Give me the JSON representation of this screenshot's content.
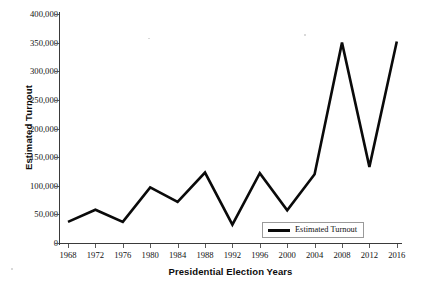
{
  "chart_data": {
    "type": "line",
    "title": "",
    "xlabel": "Presidential Election Years",
    "ylabel": "Estimated Turnout",
    "categories": [
      "1968",
      "1972",
      "1976",
      "1980",
      "1984",
      "1988",
      "1992",
      "1996",
      "2000",
      "2004",
      "2008",
      "2012",
      "2016"
    ],
    "series": [
      {
        "name": "Estimated Turnout",
        "color": "#0a0a0a",
        "values": [
          37000,
          58000,
          37000,
          97000,
          72000,
          123000,
          32000,
          122000,
          57000,
          120000,
          350000,
          133000,
          352000
        ]
      }
    ],
    "ylim": [
      0,
      400000
    ],
    "ytick_values": [
      0,
      50000,
      100000,
      150000,
      200000,
      250000,
      300000,
      350000,
      400000
    ],
    "ytick_labels": [
      "0",
      "50,000",
      "100,000",
      "150,000",
      "200,000",
      "250,000",
      "300,000",
      "350,000",
      "400,000"
    ],
    "grid": false,
    "legend_position": "inside-bottom-right",
    "legend_entries": [
      "Estimated Turnout"
    ]
  },
  "axes": {
    "y_title": "Estimated Turnout",
    "x_title": "Presidential Election Years"
  },
  "legend": {
    "items": [
      {
        "label": "Estimated Turnout"
      }
    ]
  }
}
